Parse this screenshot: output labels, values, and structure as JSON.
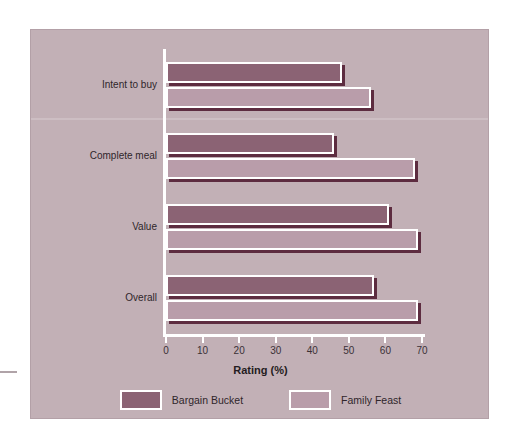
{
  "chart_data": {
    "type": "bar",
    "orientation": "horizontal",
    "title": "",
    "xlabel": "Rating (%)",
    "ylabel": "",
    "xlim": [
      0,
      70
    ],
    "xticks": [
      0,
      10,
      20,
      30,
      40,
      50,
      60,
      70
    ],
    "grid": false,
    "legend_position": "bottom",
    "categories": [
      "Intent to buy",
      "Complete meal",
      "Value",
      "Overall"
    ],
    "series": [
      {
        "name": "Bargain Bucket",
        "color": "#8b6374",
        "values": [
          48,
          46,
          61,
          57
        ]
      },
      {
        "name": "Family Feast",
        "color": "#b99daa",
        "values": [
          56,
          68,
          69,
          69
        ]
      }
    ]
  },
  "panel": {
    "background_color": "#c2b0b6",
    "axis_color": "#ffffff",
    "shadow_color": "#5d2c40"
  }
}
